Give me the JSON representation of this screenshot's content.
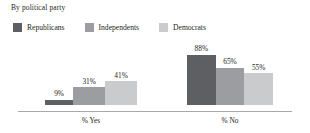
{
  "legend": {
    "title": "By political party",
    "items": [
      {
        "label": "Republicans",
        "color": "#5d5f63",
        "swatch_icon": "legend-swatch-square"
      },
      {
        "label": "Independents",
        "color": "#9b9da1",
        "swatch_icon": "legend-swatch-square"
      },
      {
        "label": "Democrats",
        "color": "#c9cbcd",
        "swatch_icon": "legend-swatch-square"
      }
    ]
  },
  "chart_data": {
    "type": "bar",
    "title": "By political party",
    "xlabel": "",
    "ylabel": "",
    "ylim": [
      0,
      115
    ],
    "grid": false,
    "legend_position": "top-left",
    "categories": [
      "% Yes",
      "% No"
    ],
    "series": [
      {
        "name": "Republicans",
        "color": "#5d5f63",
        "values": [
          9,
          88
        ],
        "labels": [
          "9%",
          "88%"
        ]
      },
      {
        "name": "Independents",
        "color": "#9b9da1",
        "values": [
          31,
          65
        ],
        "labels": [
          "31%",
          "65%"
        ]
      },
      {
        "name": "Democrats",
        "color": "#c9cbcd",
        "values": [
          41,
          55
        ],
        "labels": [
          "41%",
          "55%"
        ]
      }
    ],
    "groups": [
      {
        "category": "% Yes",
        "bars": [
          {
            "series": "Republicans",
            "value": 9,
            "label": "9%",
            "color": "#5d5f63"
          },
          {
            "series": "Independents",
            "value": 31,
            "label": "31%",
            "color": "#9b9da1"
          },
          {
            "series": "Democrats",
            "value": 41,
            "label": "41%",
            "color": "#c9cbcd"
          }
        ]
      },
      {
        "category": "% No",
        "bars": [
          {
            "series": "Republicans",
            "value": 88,
            "label": "88%",
            "color": "#5d5f63"
          },
          {
            "series": "Independents",
            "value": 65,
            "label": "65%",
            "color": "#9b9da1"
          },
          {
            "series": "Democrats",
            "value": 55,
            "label": "55%",
            "color": "#c9cbcd"
          }
        ]
      }
    ]
  },
  "axis": {
    "baseline_color": "#a8a8a8"
  }
}
